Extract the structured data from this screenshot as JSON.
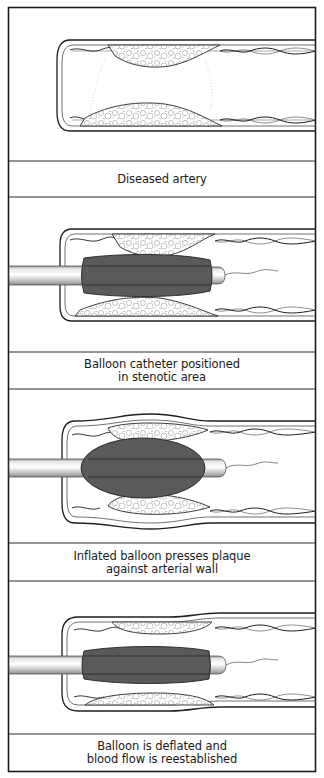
{
  "figure": {
    "colors": {
      "frame": "#1c1c1c",
      "balloon": "#5a5a5a",
      "catheter": "#d4d4d4",
      "plaque_stroke": "#3a3a3a",
      "background": "#ffffff"
    },
    "panels": [
      {
        "id": "diseased-artery",
        "caption_lines": [
          "Diseased artery"
        ],
        "shows_catheter": false,
        "balloon_state": "none"
      },
      {
        "id": "balloon-positioned",
        "caption_lines": [
          "Balloon catheter positioned",
          "in stenotic area"
        ],
        "shows_catheter": true,
        "balloon_state": "deflated-in-position"
      },
      {
        "id": "balloon-inflated",
        "caption_lines": [
          "Inflated balloon presses plaque",
          "against arterial wall"
        ],
        "shows_catheter": true,
        "balloon_state": "inflated"
      },
      {
        "id": "balloon-deflated",
        "caption_lines": [
          "Balloon is deflated and",
          "blood flow is reestablished"
        ],
        "shows_catheter": true,
        "balloon_state": "deflated"
      }
    ]
  }
}
